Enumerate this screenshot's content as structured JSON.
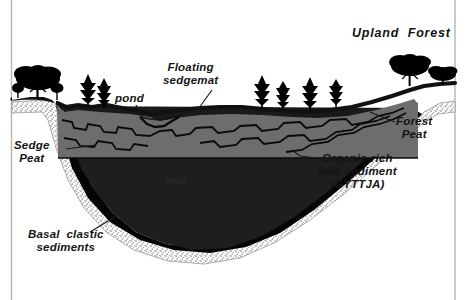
{
  "figure": {
    "background_color": "#ffffff",
    "border_color": "#b4b4b4"
  },
  "palette": {
    "sedge_peat_gray": "#6d6d6d",
    "gyttja_dark": "#1e1e1e",
    "marl_dark": "#1a1a1a",
    "basal_black": "#050505",
    "stipple_light": "#cfcfcf",
    "outline_black": "#000000",
    "label_text": "#141414"
  },
  "labels": {
    "upland_forest": "Upland  Forest",
    "floating_sedgemat": "Floating\nsedgemat",
    "pond": "pond",
    "sedge_peat": "Sedge\nPeat",
    "forest_peat": "Forest\nPeat",
    "organic_rich": "Organic-rich\nlake sediment\n(GYTTJA)",
    "marl": "Marl",
    "basal_clastic": "Basal  clastic\nsediments"
  },
  "strata": [
    {
      "name": "sedge-peat",
      "label": "Sedge Peat",
      "color": "#6d6d6d",
      "position": "upper bog surface layer"
    },
    {
      "name": "forest-peat",
      "label": "Forest Peat",
      "color": "#6d6d6d",
      "position": "basin margin, right flank"
    },
    {
      "name": "gyttja",
      "label": "Organic-rich lake sediment (GYTTJA)",
      "color": "#1e1e1e",
      "position": "beneath peat"
    },
    {
      "name": "marl",
      "label": "Marl",
      "color": "#1a1a1a",
      "position": "basin center core"
    },
    {
      "name": "basal-clastic",
      "label": "Basal clastic sediments",
      "color": "#050505",
      "position": "basin floor"
    }
  ],
  "features": [
    {
      "name": "pond",
      "label": "pond"
    },
    {
      "name": "floating-sedgemat",
      "label": "Floating sedgemat"
    },
    {
      "name": "upland-forest",
      "label": "Upland Forest"
    }
  ],
  "vegetation": {
    "deciduous_tree_count": 3,
    "conifer_tree_count": 5
  }
}
